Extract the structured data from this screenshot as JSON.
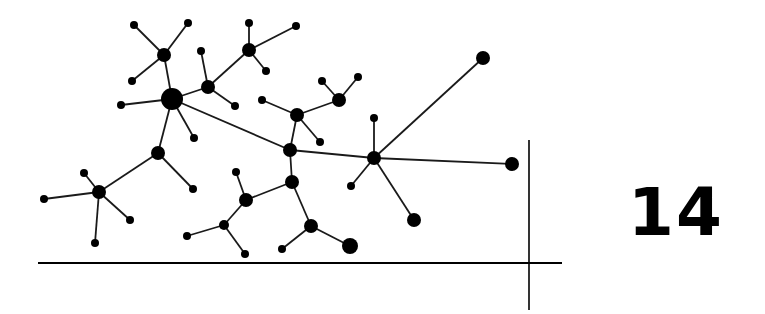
{
  "figure": {
    "number_label": "14",
    "colors": {
      "ink": "#000000",
      "background": "#ffffff",
      "edge": "#1a1a1a"
    },
    "axes": {
      "horizontal": {
        "x1": 38,
        "y1": 263,
        "x2": 562,
        "y2": 263
      },
      "vertical": {
        "x1": 529,
        "y1": 140,
        "x2": 529,
        "y2": 310
      }
    },
    "nodes": [
      {
        "id": "A",
        "x": 172,
        "y": 99,
        "r": 11
      },
      {
        "id": "B",
        "x": 164,
        "y": 55,
        "r": 7
      },
      {
        "id": "b1",
        "x": 134,
        "y": 25,
        "r": 4
      },
      {
        "id": "b2",
        "x": 188,
        "y": 23,
        "r": 4
      },
      {
        "id": "b3",
        "x": 132,
        "y": 81,
        "r": 4
      },
      {
        "id": "a1",
        "x": 121,
        "y": 105,
        "r": 4
      },
      {
        "id": "C",
        "x": 208,
        "y": 87,
        "r": 7
      },
      {
        "id": "c1",
        "x": 201,
        "y": 51,
        "r": 4
      },
      {
        "id": "c2",
        "x": 235,
        "y": 106,
        "r": 4
      },
      {
        "id": "D",
        "x": 249,
        "y": 50,
        "r": 7
      },
      {
        "id": "d1",
        "x": 249,
        "y": 23,
        "r": 4
      },
      {
        "id": "d2",
        "x": 296,
        "y": 26,
        "r": 4
      },
      {
        "id": "d3",
        "x": 266,
        "y": 71,
        "r": 4
      },
      {
        "id": "a2",
        "x": 194,
        "y": 138,
        "r": 4
      },
      {
        "id": "E",
        "x": 158,
        "y": 153,
        "r": 7
      },
      {
        "id": "e1",
        "x": 193,
        "y": 189,
        "r": 4
      },
      {
        "id": "F",
        "x": 99,
        "y": 192,
        "r": 7
      },
      {
        "id": "f1",
        "x": 44,
        "y": 199,
        "r": 4
      },
      {
        "id": "f2",
        "x": 84,
        "y": 173,
        "r": 4
      },
      {
        "id": "f3",
        "x": 130,
        "y": 220,
        "r": 4
      },
      {
        "id": "f4",
        "x": 95,
        "y": 243,
        "r": 4
      },
      {
        "id": "G",
        "x": 297,
        "y": 115,
        "r": 7
      },
      {
        "id": "g1",
        "x": 262,
        "y": 100,
        "r": 4
      },
      {
        "id": "g2",
        "x": 320,
        "y": 142,
        "r": 4
      },
      {
        "id": "H",
        "x": 339,
        "y": 100,
        "r": 7
      },
      {
        "id": "h1",
        "x": 322,
        "y": 81,
        "r": 4
      },
      {
        "id": "h2",
        "x": 358,
        "y": 77,
        "r": 4
      },
      {
        "id": "I",
        "x": 290,
        "y": 150,
        "r": 7
      },
      {
        "id": "J",
        "x": 374,
        "y": 158,
        "r": 7
      },
      {
        "id": "j1",
        "x": 374,
        "y": 118,
        "r": 4
      },
      {
        "id": "j2",
        "x": 483,
        "y": 58,
        "r": 7
      },
      {
        "id": "j3",
        "x": 512,
        "y": 164,
        "r": 7
      },
      {
        "id": "j4",
        "x": 351,
        "y": 186,
        "r": 4
      },
      {
        "id": "j5",
        "x": 414,
        "y": 220,
        "r": 7
      },
      {
        "id": "K",
        "x": 292,
        "y": 182,
        "r": 7
      },
      {
        "id": "L",
        "x": 246,
        "y": 200,
        "r": 7
      },
      {
        "id": "l1",
        "x": 236,
        "y": 172,
        "r": 4
      },
      {
        "id": "M",
        "x": 224,
        "y": 225,
        "r": 5
      },
      {
        "id": "m1",
        "x": 187,
        "y": 236,
        "r": 4
      },
      {
        "id": "m2",
        "x": 245,
        "y": 254,
        "r": 4
      },
      {
        "id": "N",
        "x": 311,
        "y": 226,
        "r": 7
      },
      {
        "id": "n1",
        "x": 282,
        "y": 249,
        "r": 4
      },
      {
        "id": "n2",
        "x": 350,
        "y": 246,
        "r": 8
      }
    ],
    "edges": [
      [
        "A",
        "B"
      ],
      [
        "B",
        "b1"
      ],
      [
        "B",
        "b2"
      ],
      [
        "B",
        "b3"
      ],
      [
        "A",
        "a1"
      ],
      [
        "A",
        "C"
      ],
      [
        "C",
        "c1"
      ],
      [
        "C",
        "c2"
      ],
      [
        "C",
        "D"
      ],
      [
        "D",
        "d1"
      ],
      [
        "D",
        "d2"
      ],
      [
        "D",
        "d3"
      ],
      [
        "A",
        "a2"
      ],
      [
        "A",
        "E"
      ],
      [
        "E",
        "e1"
      ],
      [
        "E",
        "F"
      ],
      [
        "F",
        "f1"
      ],
      [
        "F",
        "f2"
      ],
      [
        "F",
        "f3"
      ],
      [
        "F",
        "f4"
      ],
      [
        "A",
        "I"
      ],
      [
        "I",
        "G"
      ],
      [
        "G",
        "g1"
      ],
      [
        "G",
        "g2"
      ],
      [
        "G",
        "H"
      ],
      [
        "H",
        "h1"
      ],
      [
        "H",
        "h2"
      ],
      [
        "I",
        "J"
      ],
      [
        "J",
        "j1"
      ],
      [
        "J",
        "j2"
      ],
      [
        "J",
        "j3"
      ],
      [
        "J",
        "j4"
      ],
      [
        "J",
        "j5"
      ],
      [
        "I",
        "K"
      ],
      [
        "K",
        "L"
      ],
      [
        "L",
        "l1"
      ],
      [
        "L",
        "M"
      ],
      [
        "M",
        "m1"
      ],
      [
        "M",
        "m2"
      ],
      [
        "K",
        "N"
      ],
      [
        "N",
        "n1"
      ],
      [
        "N",
        "n2"
      ]
    ]
  }
}
